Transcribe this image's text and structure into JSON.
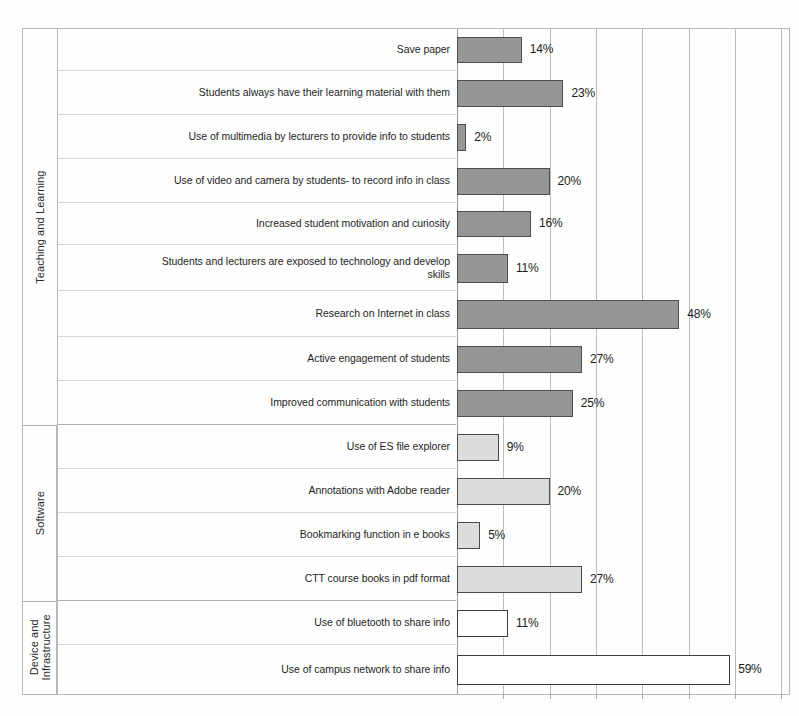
{
  "chart_data": {
    "type": "bar",
    "orientation": "horizontal",
    "title": "",
    "subtitle": "",
    "xlabel": "",
    "ylabel": "",
    "xlim": [
      0,
      70
    ],
    "grid": true,
    "gridline_step": 10,
    "value_suffix": "%",
    "legend_position": "none",
    "group_axis_labels": [
      "Teaching and Learning",
      "Software",
      "Device and Infrastructure"
    ],
    "groups": [
      {
        "name": "Teaching and Learning",
        "fill_color": "#969696",
        "border_color": "#4d4d4d",
        "categories": [
          "Save paper",
          "Students always have their learning material with them",
          "Use of multimedia by lecturers to provide info to students",
          "Use of video and camera by students- to record info in class",
          "Increased student motivation and curiosity",
          "Students and lecturers are exposed to technology and develop skills",
          "Research on Internet in class",
          "Active engagement of students",
          "Improved communication with students"
        ],
        "values": [
          14,
          23,
          2,
          20,
          16,
          11,
          48,
          27,
          25
        ],
        "value_labels": [
          "14%",
          "23%",
          "2%",
          "20%",
          "16%",
          "11%",
          "48%",
          "27%",
          "25%"
        ]
      },
      {
        "name": "Software",
        "fill_color": "#dcdcdc",
        "border_color": "#4a4a4a",
        "categories": [
          "Use of ES file explorer",
          "Annotations with Adobe reader",
          "Bookmarking function in e books",
          "CTT course books in pdf format"
        ],
        "values": [
          9,
          20,
          5,
          27
        ],
        "value_labels": [
          "9%",
          "20%",
          "5%",
          "27%"
        ]
      },
      {
        "name": "Device and Infrastructure",
        "fill_color": "#ffffff",
        "border_color": "#3d3d3d",
        "categories": [
          "Use of bluetooth to share info",
          "Use of campus network to share info"
        ],
        "values": [
          11,
          59
        ],
        "value_labels": [
          "11%",
          "59%"
        ]
      }
    ],
    "categories": [
      "Save paper",
      "Students always have their learning material with them",
      "Use of multimedia by lecturers to provide info to students",
      "Use of video and camera by students- to record info in class",
      "Increased student motivation and curiosity",
      "Students and lecturers are exposed to technology and develop skills",
      "Research on Internet in class",
      "Active engagement of students",
      "Improved communication with students",
      "Use of ES file explorer",
      "Annotations with Adobe reader",
      "Bookmarking function in e books",
      "CTT course books in pdf format",
      "Use of bluetooth to share info",
      "Use of campus network to share info"
    ],
    "values": [
      14,
      23,
      2,
      20,
      16,
      11,
      48,
      27,
      25,
      9,
      20,
      5,
      27,
      11,
      59
    ]
  }
}
